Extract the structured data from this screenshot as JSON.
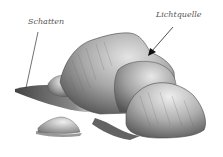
{
  "illustration": {
    "subject": "pencil drawing of rocks with light and shadow",
    "labels": {
      "shadow": "Schatten",
      "light_source": "Lichtquelle"
    },
    "colors": {
      "background": "#ffffff",
      "rock_light": "#d8d8d8",
      "rock_mid": "#9a9a9a",
      "rock_dark": "#4a4a4a",
      "shadow": "#3a3a3a",
      "label_text": "#555555"
    }
  }
}
